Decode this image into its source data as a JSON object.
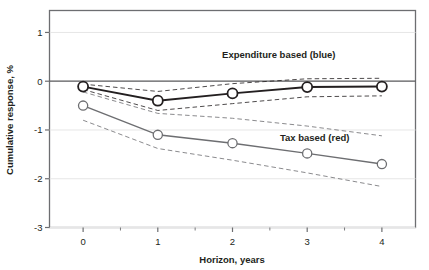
{
  "chart_data": {
    "type": "line",
    "title": "",
    "subtitle": "",
    "xlabel": "Horizon, years",
    "ylabel": "Cumulative response, %",
    "x": [
      0,
      1,
      2,
      3,
      4
    ],
    "xticklabels": [
      "0",
      "1",
      "2",
      "3",
      "4"
    ],
    "yticklabels": [
      "1",
      "0",
      "-1",
      "-2",
      "-3"
    ],
    "yticks": [
      1,
      0,
      -1,
      -2,
      -3
    ],
    "xlim": [
      -0.45,
      4.45
    ],
    "ylim": [
      -3,
      1.45
    ],
    "grid": "horizontal-light",
    "legend_position": "inline-annotation",
    "series": [
      {
        "name": "Expenditure based (blue)",
        "label": "Expenditure based (blue)",
        "style": "solid-with-open-circle-markers",
        "color": "#231f20",
        "values": [
          -0.11,
          -0.4,
          -0.25,
          -0.12,
          -0.11
        ],
        "band_upper": {
          "style": "dashed",
          "values": [
            -0.06,
            -0.21,
            -0.05,
            0.05,
            0.06
          ]
        },
        "band_lower": {
          "style": "dashed",
          "values": [
            -0.17,
            -0.6,
            -0.46,
            -0.32,
            -0.3
          ]
        }
      },
      {
        "name": "Tax based (red)",
        "label": "Tax based (red)",
        "style": "solid-with-open-circle-markers",
        "color": "#6d6e71",
        "values": [
          -0.5,
          -1.1,
          -1.27,
          -1.48,
          -1.7
        ],
        "band_upper": {
          "style": "dashed",
          "values": [
            -0.22,
            -0.66,
            -0.76,
            -0.92,
            -1.12
          ]
        },
        "band_lower": {
          "style": "dashed",
          "values": [
            -0.8,
            -1.38,
            -1.62,
            -1.88,
            -2.16
          ]
        }
      }
    ],
    "annotations": [
      {
        "text": "Expenditure based (blue)",
        "x": 2.62,
        "y": 0.48
      },
      {
        "text": "Tax based (red)",
        "x": 3.1,
        "y": -1.22
      }
    ]
  },
  "colors": {
    "frame": "#6d6e71",
    "gridline": "#e6e6e6",
    "zero_line": "#58595b",
    "expenditure": "#231f20",
    "tax": "#6d6e71",
    "text": "#231f20",
    "background": "#ffffff"
  }
}
